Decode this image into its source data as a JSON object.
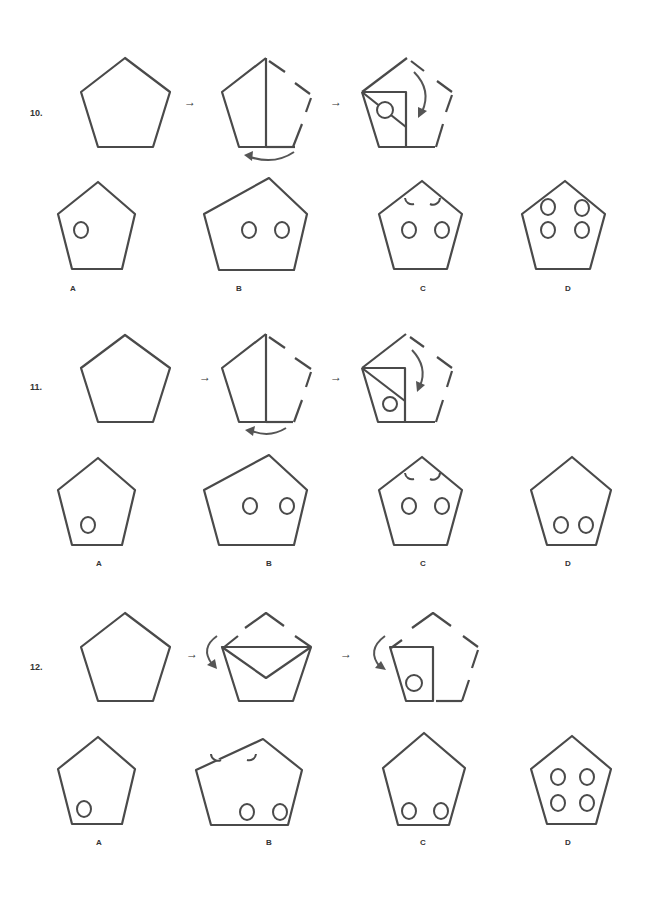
{
  "problems": [
    {
      "number": "10.",
      "steps": [
        "pentagon",
        "fold-vertical-half-arrow-left",
        "fold-corner-diagonal-with-hole"
      ],
      "step_arrow": "→",
      "options": [
        {
          "label": "A",
          "holes": 1
        },
        {
          "label": "B",
          "holes": 2
        },
        {
          "label": "C",
          "holes": "2 + 2 half-circles at top edges"
        },
        {
          "label": "D",
          "holes": 4
        }
      ]
    },
    {
      "number": "11.",
      "steps": [
        "pentagon",
        "fold-vertical-half-arrow-left",
        "fold-corner-diagonal-with-hole-low"
      ],
      "step_arrow": "→",
      "options": [
        {
          "label": "A",
          "holes": 1
        },
        {
          "label": "B",
          "holes": 2
        },
        {
          "label": "C",
          "holes": "2 + 2 half-circles at top edges"
        },
        {
          "label": "D",
          "holes": 2
        }
      ]
    },
    {
      "number": "12.",
      "steps": [
        "pentagon",
        "fold-top-down",
        "fold-left-in-with-hole"
      ],
      "step_arrow": "→",
      "options": [
        {
          "label": "A",
          "holes": 1
        },
        {
          "label": "B",
          "holes": "2 + 2 half-circles at top edges"
        },
        {
          "label": "C",
          "holes": 2
        },
        {
          "label": "D",
          "holes": 4
        }
      ]
    }
  ],
  "colors": {
    "stroke": "#4a4a4a",
    "background": "#ffffff"
  }
}
